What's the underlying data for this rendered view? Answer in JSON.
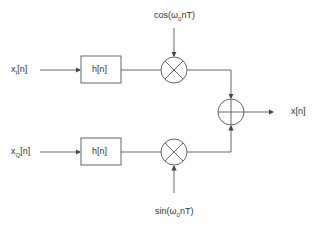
{
  "diagram": {
    "inputs": {
      "top": {
        "base": "x",
        "sub": "I",
        "rest": "[n]"
      },
      "bottom": {
        "base": "x",
        "sub": "Q",
        "rest": "[n]"
      }
    },
    "filters": {
      "top": "h[n]",
      "bottom": "h[n]"
    },
    "carriers": {
      "top": {
        "pre": "cos(ω",
        "sub": "0",
        "post": "nT)"
      },
      "bottom": {
        "pre": "sin(ω",
        "sub": "0",
        "post": "nT)"
      }
    },
    "output": "x[n]",
    "colors": {
      "line": "#444444",
      "text": "#333333"
    }
  }
}
